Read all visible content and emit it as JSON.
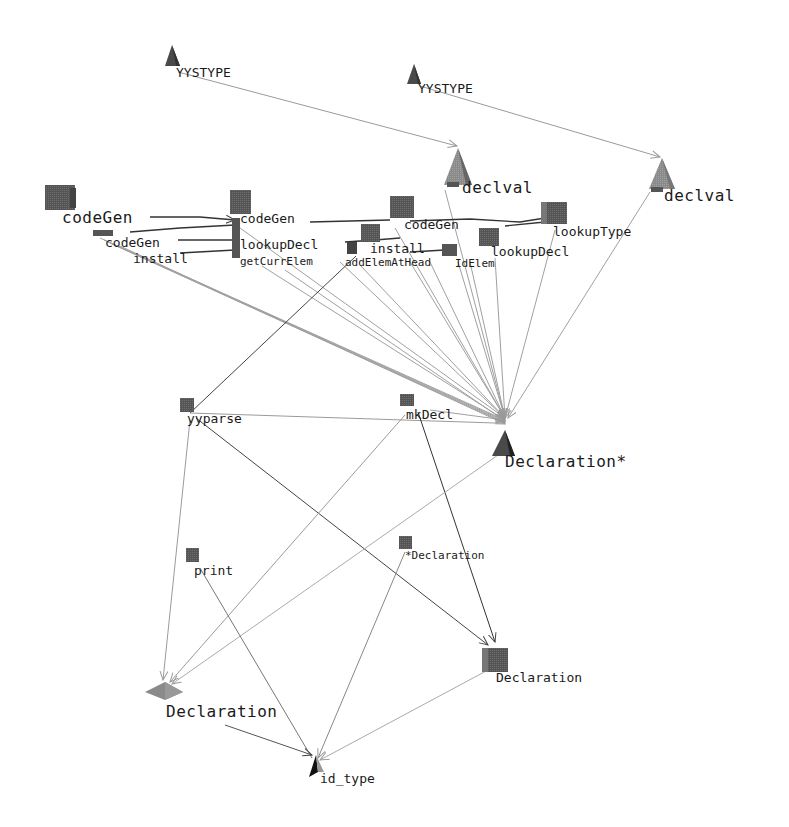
{
  "diagram": {
    "type": "3d-call-graph",
    "background": "#ffffff",
    "colors": {
      "node_dark": "#4a4a4a",
      "node_mid": "#6a6a6a",
      "node_light": "#8a8a8a",
      "edge_light": "#9a9a9a",
      "edge_dark": "#444444",
      "label": "#1a1a1a"
    },
    "nodes": [
      {
        "id": "yystype1",
        "label": "YYSTYPE",
        "shape": "cone",
        "x": 172,
        "y": 62
      },
      {
        "id": "yystype2",
        "label": "YYSTYPE",
        "shape": "cone",
        "x": 414,
        "y": 78
      },
      {
        "id": "declval1",
        "label": "declval",
        "shape": "cone",
        "x": 457,
        "y": 168
      },
      {
        "id": "declval2",
        "label": "declval",
        "shape": "cone",
        "x": 662,
        "y": 178
      },
      {
        "id": "codegen1",
        "label": "codeGen",
        "shape": "cube",
        "x": 60,
        "y": 197
      },
      {
        "id": "codegen2",
        "label": "codeGen",
        "shape": "cube",
        "x": 240,
        "y": 203
      },
      {
        "id": "codegen3",
        "label": "codeGen",
        "shape": "cube",
        "x": 402,
        "y": 208
      },
      {
        "id": "codegen_small",
        "label": "codeGen",
        "shape": "flat",
        "x": 103,
        "y": 232
      },
      {
        "id": "install1",
        "label": "install",
        "shape": "edge-label",
        "x": 150,
        "y": 260
      },
      {
        "id": "lookupdecl1",
        "label": "lookupDecl",
        "shape": "cube",
        "x": 240,
        "y": 243
      },
      {
        "id": "getcurrelem",
        "label": "getCurrElem",
        "shape": "edge-label",
        "x": 242,
        "y": 264
      },
      {
        "id": "install2",
        "label": "install",
        "shape": "cube",
        "x": 370,
        "y": 232
      },
      {
        "id": "addelemathead",
        "label": "addElemAtHead",
        "shape": "cube",
        "x": 353,
        "y": 248
      },
      {
        "id": "idelem",
        "label": "IdElem",
        "shape": "cube",
        "x": 450,
        "y": 250
      },
      {
        "id": "lookupdecl2",
        "label": "lookupDecl",
        "shape": "cube",
        "x": 490,
        "y": 237
      },
      {
        "id": "lookuptype",
        "label": "lookupType",
        "shape": "cube",
        "x": 555,
        "y": 212
      },
      {
        "id": "yyparse",
        "label": "yyparse",
        "shape": "cube",
        "x": 187,
        "y": 405
      },
      {
        "id": "mkdecl",
        "label": "mkDecl",
        "shape": "cube",
        "x": 406,
        "y": 402
      },
      {
        "id": "declaration_ptr",
        "label": "Declaration*",
        "shape": "cone",
        "x": 503,
        "y": 440
      },
      {
        "id": "print",
        "label": "print",
        "shape": "cube",
        "x": 193,
        "y": 556
      },
      {
        "id": "declaration_q",
        "label": "*Declaration",
        "shape": "cube",
        "x": 405,
        "y": 542
      },
      {
        "id": "declaration_box",
        "label": "Declaration",
        "shape": "cube",
        "x": 492,
        "y": 658
      },
      {
        "id": "declaration_diamond",
        "label": "Declaration",
        "shape": "diamond",
        "x": 165,
        "y": 692
      },
      {
        "id": "id_type",
        "label": "id_type",
        "shape": "cone",
        "x": 315,
        "y": 768
      }
    ],
    "labels": {
      "yystype1": "YYSTYPE",
      "yystype2": "YYSTYPE",
      "declval1": "declval",
      "declval2": "declval",
      "codegen1": "codeGen",
      "codegen2": "codeGen",
      "codegen3": "codeGen",
      "codegen_small": "codeGen",
      "install1": "install",
      "lookupdecl1": "lookupDecl",
      "getcurrelem": "getCurrElem",
      "install2": "install",
      "addelemathead": "addElemAtHead",
      "idelem": "IdElem",
      "lookupdecl2": "lookupDecl",
      "lookuptype": "lookupType",
      "yyparse": "yyparse",
      "mkdecl": "mkDecl",
      "declaration_ptr": "Declaration*",
      "print": "print",
      "declaration_q": "*Declaration",
      "declaration_box": "Declaration",
      "declaration_diamond": "Declaration",
      "id_type": "id_type"
    }
  }
}
